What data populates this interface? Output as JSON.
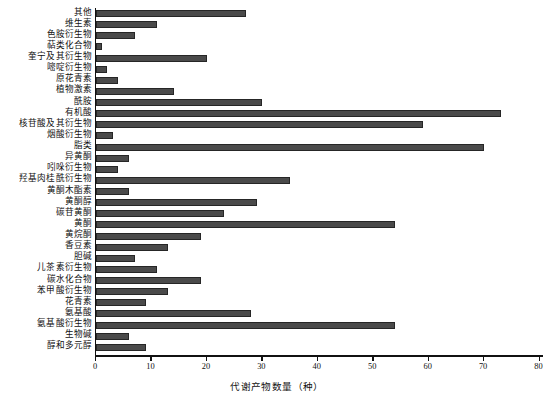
{
  "chart_data": {
    "type": "bar",
    "orientation": "horizontal",
    "title": "",
    "xlabel": "代谢产物数量（种）",
    "ylabel": "",
    "xlim": [
      0,
      80.8
    ],
    "xticks": [
      0,
      10,
      20,
      30,
      40,
      50,
      60,
      70,
      80
    ],
    "grid": false,
    "legend": null,
    "bar_color": "#4a4a4a",
    "bar_edge_color": "#262626",
    "axis_color": "#111111",
    "categories": [
      "其他",
      "维生素",
      "色胺衍生物",
      "萜类化合物",
      "奎宁及其衍生物",
      "嘧啶衍生物",
      "原花青素",
      "植物激素",
      "酰胺",
      "有机酸",
      "核苷酸及其衍生物",
      "烟酸衍生物",
      "脂类",
      "异黄酮",
      "吲哚衍生物",
      "羟基肉桂酰衍生物",
      "黄酮木酯素",
      "黄酮醇",
      "碳苷黄酮",
      "黄酮",
      "黄烷酮",
      "香豆素",
      "胆碱",
      "儿茶素衍生物",
      "碳水化合物",
      "苯甲酸衍生物",
      "花青素",
      "氨基酸",
      "氨基酸衍生物",
      "生物碱",
      "醇和多元醇"
    ],
    "values": [
      27,
      11,
      7,
      1,
      20,
      2,
      4,
      14,
      30,
      73,
      59,
      3,
      70,
      6,
      4,
      35,
      6,
      29,
      23,
      54,
      19,
      13,
      7,
      11,
      19,
      13,
      9,
      28,
      54,
      6,
      9
    ]
  },
  "caption": {
    "text": ""
  }
}
